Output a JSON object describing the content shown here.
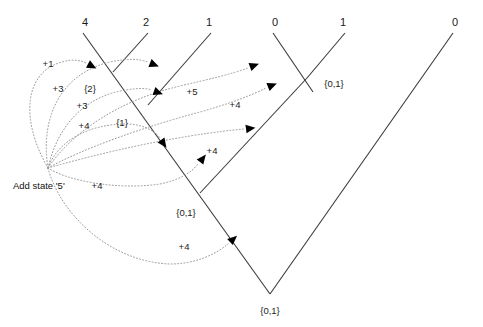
{
  "diagram": {
    "title": "Add state '5'",
    "caption": {
      "text": "Add state '5'",
      "x": 13,
      "y": 181
    },
    "colors": {
      "tree_line": "#3a3a3a",
      "arrow_curve": "#9a9a9a",
      "arrow_head": "#000000",
      "text": "#1a1a1a",
      "background": "#ffffff"
    },
    "leaf_labels": [
      {
        "name": "leaf-4",
        "text": "4",
        "x": 85,
        "y": 17
      },
      {
        "name": "leaf-2",
        "text": "2",
        "x": 146,
        "y": 17
      },
      {
        "name": "leaf-1a",
        "text": "1",
        "x": 209,
        "y": 17
      },
      {
        "name": "leaf-0a",
        "text": "0",
        "x": 275,
        "y": 17
      },
      {
        "name": "leaf-1b",
        "text": "1",
        "x": 343,
        "y": 17
      },
      {
        "name": "leaf-0b",
        "text": "0",
        "x": 455,
        "y": 17
      }
    ],
    "state_labels": [
      {
        "name": "state-set-2",
        "text": "{2}",
        "x": 90,
        "y": 84
      },
      {
        "name": "state-set-1",
        "text": "{1}",
        "x": 122,
        "y": 118
      },
      {
        "name": "state-set-01-right",
        "text": "{0,1}",
        "x": 334,
        "y": 79
      },
      {
        "name": "state-set-01-mid",
        "text": "{0,1}",
        "x": 186,
        "y": 208
      },
      {
        "name": "state-set-01-root",
        "text": "{0,1}",
        "x": 270,
        "y": 306
      }
    ],
    "cost_labels": [
      {
        "name": "cost-plus-1",
        "text": "+1",
        "x": 48,
        "y": 59
      },
      {
        "name": "cost-plus-3-upper",
        "text": "+3",
        "x": 58,
        "y": 84
      },
      {
        "name": "cost-plus-3-lower",
        "text": "+3",
        "x": 82,
        "y": 101
      },
      {
        "name": "cost-plus-4-upper",
        "text": "+4",
        "x": 84,
        "y": 121
      },
      {
        "name": "cost-plus-5",
        "text": "+5",
        "x": 192,
        "y": 87
      },
      {
        "name": "cost-plus-4-right",
        "text": "+4",
        "x": 235,
        "y": 100
      },
      {
        "name": "cost-plus-4-mid",
        "text": "+4",
        "x": 212,
        "y": 146
      },
      {
        "name": "cost-plus-4-left",
        "text": "+4",
        "x": 97,
        "y": 181
      },
      {
        "name": "cost-plus-4-bottom",
        "text": "+4",
        "x": 184,
        "y": 242
      }
    ],
    "tree_edges": [
      {
        "name": "edge-leaf-4-to-root",
        "x1": 83,
        "y1": 33,
        "x2": 270,
        "y2": 294
      },
      {
        "name": "edge-leaf-2",
        "x1": 148,
        "y1": 33,
        "x2": 113,
        "y2": 72
      },
      {
        "name": "edge-leaf-1a",
        "x1": 211,
        "y1": 33,
        "x2": 148,
        "y2": 105
      },
      {
        "name": "edge-leaf-0a",
        "x1": 273,
        "y1": 33,
        "x2": 313,
        "y2": 92
      },
      {
        "name": "edge-leaf-1b",
        "x1": 345,
        "y1": 33,
        "x2": 307,
        "y2": 78
      },
      {
        "name": "edge-internal-right",
        "x1": 307,
        "y1": 78,
        "x2": 200,
        "y2": 193
      },
      {
        "name": "edge-leaf-0b-to-root",
        "x1": 453,
        "y1": 33,
        "x2": 270,
        "y2": 294
      }
    ],
    "origin_point": {
      "name": "arrow-origin",
      "x": 48,
      "y": 168
    },
    "arrows": [
      {
        "name": "arrow-to-leaf-4",
        "label": "+1",
        "path": "M 48 168 C 20 120, 24 72, 62 62 C 72 59, 80 60, 86 63",
        "head": {
          "x": 88,
          "y": 64,
          "angle": 28
        }
      },
      {
        "name": "arrow-to-node-2",
        "label": "+3",
        "path": "M 48 168 C 40 118, 60 74, 110 62 C 128 58, 140 59, 148 62",
        "head": {
          "x": 150,
          "y": 63,
          "angle": 22
        }
      },
      {
        "name": "arrow-to-node-1",
        "label": "+3",
        "path": "M 48 168 C 58 124, 86 96, 126 90 C 138 88, 146 88, 152 90",
        "head": {
          "x": 154,
          "y": 91,
          "angle": 20
        }
      },
      {
        "name": "arrow-to-node-5",
        "label": "+5",
        "path": "M 48 168 C 72 132, 120 100, 180 86 C 210 79, 232 74, 248 68",
        "head": {
          "x": 250,
          "y": 67,
          "angle": -20
        }
      },
      {
        "name": "arrow-to-node-4-right",
        "label": "+4",
        "path": "M 48 168 C 80 150, 140 128, 200 112 C 232 103, 252 95, 266 88",
        "head": {
          "x": 268,
          "y": 87,
          "angle": -22
        }
      },
      {
        "name": "arrow-to-node-4-mid",
        "label": "+4",
        "path": "M 48 168 C 90 156, 140 144, 190 136 C 215 132, 232 130, 244 129",
        "head": {
          "x": 246,
          "y": 129,
          "angle": -8
        }
      },
      {
        "name": "arrow-to-node-4-upper",
        "label": "+4",
        "path": "M 48 168 C 58 140, 90 124, 126 124 C 142 124, 154 130, 160 138",
        "head": {
          "x": 161,
          "y": 140,
          "angle": 55
        }
      },
      {
        "name": "arrow-to-node-4-left",
        "label": "+4",
        "path": "M 48 168 C 70 182, 120 190, 160 184 C 180 180, 192 172, 198 164",
        "head": {
          "x": 200,
          "y": 162,
          "angle": -52
        }
      },
      {
        "name": "arrow-to-root-4",
        "label": "+4",
        "path": "M 48 168 C 60 214, 110 262, 170 264 C 196 264, 216 254, 228 244",
        "head": {
          "x": 230,
          "y": 242,
          "angle": -42
        }
      }
    ]
  }
}
